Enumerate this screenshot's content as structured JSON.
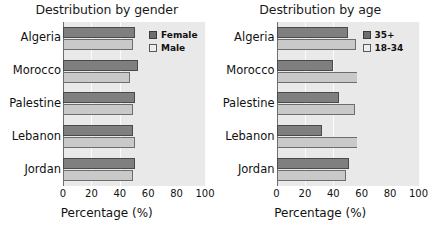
{
  "chart_data": [
    {
      "type": "bar",
      "orientation": "horizontal",
      "title": "Destribution by gender",
      "xlabel": "Percentage (%)",
      "ylabel": "",
      "categories": [
        "Algeria",
        "Morocco",
        "Palestine",
        "Lebanon",
        "Jordan"
      ],
      "series": [
        {
          "name": "Female",
          "color": "#7f7f7f",
          "values": [
            51,
            53,
            51,
            49,
            51
          ]
        },
        {
          "name": "Male",
          "color": "#c9c9c9",
          "values": [
            49,
            47,
            49,
            51,
            49
          ]
        }
      ],
      "xticks": [
        0,
        20,
        40,
        60,
        80,
        100
      ],
      "xlim": [
        0,
        100
      ],
      "grid": true,
      "legend_position": "right"
    },
    {
      "type": "bar",
      "orientation": "horizontal",
      "title": "Destribution by age",
      "xlabel": "Percentage (%)",
      "ylabel": "",
      "categories": [
        "Algeria",
        "Morocco",
        "Palestine",
        "Lebanon",
        "Jordan"
      ],
      "series": [
        {
          "name": "35+",
          "color": "#7f7f7f",
          "values": [
            50,
            40,
            44,
            32,
            51
          ]
        },
        {
          "name": "18-34",
          "color": "#c9c9c9",
          "values": [
            56,
            65,
            55,
            67,
            49
          ]
        }
      ],
      "xticks": [
        0,
        20,
        40,
        60,
        80,
        100
      ],
      "xlim": [
        0,
        100
      ],
      "grid": true,
      "legend_position": "right"
    }
  ],
  "panels": [
    {
      "title": "Destribution by gender",
      "axis_title": "Percentage (%)",
      "categories": [
        "Algeria",
        "Morocco",
        "Palestine",
        "Lebanon",
        "Jordan"
      ],
      "ticks": [
        "0",
        "20",
        "40",
        "60",
        "80",
        "100"
      ],
      "legend": [
        {
          "label": "Female",
          "swatch": "dark"
        },
        {
          "label": "Male",
          "swatch": "light"
        }
      ]
    },
    {
      "title": "Destribution by age",
      "axis_title": "Percentage (%)",
      "categories": [
        "Algeria",
        "Morocco",
        "Palestine",
        "Lebanon",
        "Jordan"
      ],
      "ticks": [
        "0",
        "20",
        "40",
        "60",
        "80",
        "100"
      ],
      "legend": [
        {
          "label": "35+",
          "swatch": "dark"
        },
        {
          "label": "18-34",
          "swatch": "light"
        }
      ]
    }
  ]
}
